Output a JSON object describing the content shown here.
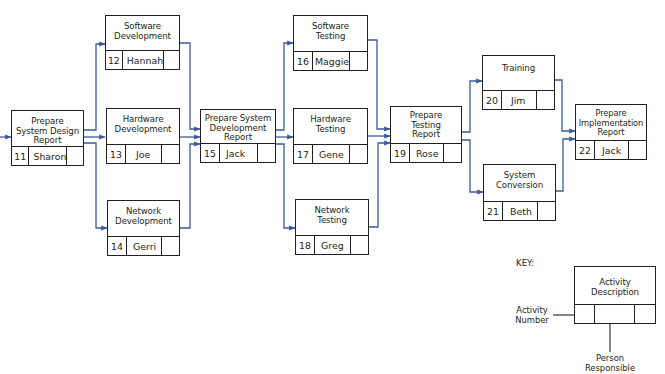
{
  "diagram": {
    "type": "PERT network / activity precedence diagram",
    "arrow_color": "#3a5a9c",
    "line_color": "#231f20",
    "nodes": [
      {
        "id": "11",
        "description": "Prepare\nSystem Design\nReport",
        "person": "Sharon"
      },
      {
        "id": "12",
        "description": "Software\nDevelopment",
        "person": "Hannah"
      },
      {
        "id": "13",
        "description": "Hardware\nDevelopment",
        "person": "Joe"
      },
      {
        "id": "14",
        "description": "Network\nDevelopment",
        "person": "Gerri"
      },
      {
        "id": "15",
        "description": "Prepare System\nDevelopment\nReport",
        "person": "Jack"
      },
      {
        "id": "16",
        "description": "Software\nTesting",
        "person": "Maggie"
      },
      {
        "id": "17",
        "description": "Hardware\nTesting",
        "person": "Gene"
      },
      {
        "id": "18",
        "description": "Network\nTesting",
        "person": "Greg"
      },
      {
        "id": "19",
        "description": "Prepare\nTesting\nReport",
        "person": "Rose"
      },
      {
        "id": "20",
        "description": "Training",
        "person": "Jim"
      },
      {
        "id": "21",
        "description": "System\nConversion",
        "person": "Beth"
      },
      {
        "id": "22",
        "description": "Prepare\nImplementation\nReport",
        "person": "Jack"
      }
    ],
    "edges": [
      [
        "start",
        "11"
      ],
      [
        "11",
        "12"
      ],
      [
        "11",
        "13"
      ],
      [
        "11",
        "14"
      ],
      [
        "12",
        "15"
      ],
      [
        "13",
        "15"
      ],
      [
        "14",
        "15"
      ],
      [
        "15",
        "16"
      ],
      [
        "15",
        "17"
      ],
      [
        "15",
        "18"
      ],
      [
        "16",
        "19"
      ],
      [
        "17",
        "19"
      ],
      [
        "18",
        "19"
      ],
      [
        "19",
        "20"
      ],
      [
        "19",
        "21"
      ],
      [
        "20",
        "22"
      ],
      [
        "21",
        "22"
      ]
    ]
  },
  "key": {
    "title": "KEY:",
    "box_description": "Activity\nDescription",
    "activity_number_label": "Activity\nNumber",
    "person_label": "Person\nResponsible"
  }
}
